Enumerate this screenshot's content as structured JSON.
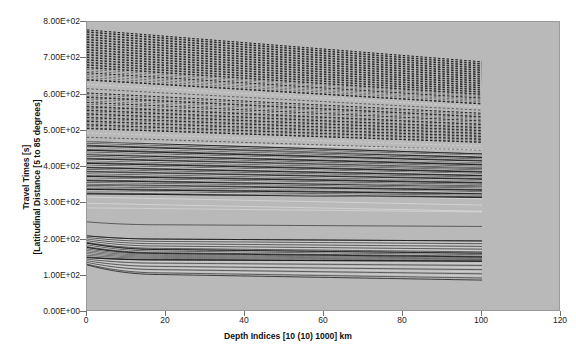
{
  "chart_data": {
    "type": "line",
    "title": "",
    "xlabel": "Depth Indices [10 (10) 1000] km",
    "ylabel_line1": "Travel Times [s]",
    "ylabel_line2": "[Latitudinal Distance [5 to 85 degrees]",
    "xlim": [
      0,
      120
    ],
    "ylim": [
      0,
      800
    ],
    "xticks": [
      0,
      20,
      40,
      60,
      80,
      100,
      120
    ],
    "xticklabels": [
      "0",
      "20",
      "40",
      "60",
      "80",
      "100",
      "120"
    ],
    "yticks": [
      0,
      100,
      200,
      300,
      400,
      500,
      600,
      700,
      800
    ],
    "yticklabels": [
      "0.00E+00",
      "1.00E+02",
      "2.00E+02",
      "3.00E+02",
      "4.00E+02",
      "5.00E+02",
      "6.00E+02",
      "7.00E+02",
      "8.00E+02"
    ],
    "grid": false,
    "legend": "none",
    "data_x_start": 0,
    "data_x_end": 100,
    "plot_bgcolor": "#b9b9b9",
    "line_color": "#151515",
    "series_note": "Dense family of seismic traveltime branches, one curve per latitudinal distance 5 to 85 degrees, plotted against depth index 10(10)1000 km.",
    "series": [
      {
        "name": "85 deg branch",
        "y_start": 778,
        "y_end": 690,
        "style": "dashed"
      },
      {
        "name": "83 deg branch",
        "y_start": 772,
        "y_end": 684,
        "style": "dashed"
      },
      {
        "name": "81 deg branch",
        "y_start": 765,
        "y_end": 678,
        "style": "dashed"
      },
      {
        "name": "79 deg branch",
        "y_start": 758,
        "y_end": 672,
        "style": "dashed"
      },
      {
        "name": "77 deg branch",
        "y_start": 751,
        "y_end": 666,
        "style": "dashed"
      },
      {
        "name": "75 deg branch",
        "y_start": 744,
        "y_end": 660,
        "style": "dashed"
      },
      {
        "name": "73 deg branch",
        "y_start": 737,
        "y_end": 654,
        "style": "dashed"
      },
      {
        "name": "71 deg branch",
        "y_start": 730,
        "y_end": 648,
        "style": "dashed"
      },
      {
        "name": "69 deg branch",
        "y_start": 723,
        "y_end": 642,
        "style": "dashed"
      },
      {
        "name": "67 deg branch",
        "y_start": 716,
        "y_end": 636,
        "style": "dashed"
      },
      {
        "name": "65 deg branch",
        "y_start": 709,
        "y_end": 630,
        "style": "dashed"
      },
      {
        "name": "63 deg branch",
        "y_start": 702,
        "y_end": 624,
        "style": "dashed"
      },
      {
        "name": "61 deg branch",
        "y_start": 695,
        "y_end": 618,
        "style": "dashed"
      },
      {
        "name": "59 deg branch",
        "y_start": 688,
        "y_end": 612,
        "style": "dashed"
      },
      {
        "name": "57 deg branch",
        "y_start": 681,
        "y_end": 606,
        "style": "dashed"
      },
      {
        "name": "55 deg branch",
        "y_start": 674,
        "y_end": 600,
        "style": "dashed"
      },
      {
        "name": "53 deg branch",
        "y_start": 660,
        "y_end": 590,
        "style": "dashed"
      },
      {
        "name": "51 deg branch",
        "y_start": 640,
        "y_end": 574,
        "style": "dashed"
      },
      {
        "name": "49 deg branch",
        "y_start": 604,
        "y_end": 548,
        "style": "dashed"
      },
      {
        "name": "47 deg branch",
        "y_start": 592,
        "y_end": 538,
        "style": "dashed"
      },
      {
        "name": "45 deg branch",
        "y_start": 578,
        "y_end": 527,
        "style": "dashed"
      },
      {
        "name": "43 deg branch",
        "y_start": 566,
        "y_end": 517,
        "style": "dashed"
      },
      {
        "name": "41 deg branch",
        "y_start": 556,
        "y_end": 508,
        "style": "dashed"
      },
      {
        "name": "39 deg branch",
        "y_start": 546,
        "y_end": 500,
        "style": "dashed"
      },
      {
        "name": "37 deg branch",
        "y_start": 536,
        "y_end": 492,
        "style": "dashed"
      },
      {
        "name": "35 deg branch",
        "y_start": 526,
        "y_end": 484,
        "style": "dashed"
      },
      {
        "name": "33 deg branch",
        "y_start": 516,
        "y_end": 476,
        "style": "dashed"
      },
      {
        "name": "31 deg branch",
        "y_start": 506,
        "y_end": 468,
        "style": "dashed"
      },
      {
        "name": "29 deg branch",
        "y_start": 470,
        "y_end": 436,
        "style": "solid"
      },
      {
        "name": "27 deg branch",
        "y_start": 458,
        "y_end": 426,
        "style": "solid"
      },
      {
        "name": "25 deg branch",
        "y_start": 446,
        "y_end": 416,
        "style": "solid"
      },
      {
        "name": "23 deg branch",
        "y_start": 434,
        "y_end": 406,
        "style": "solid"
      },
      {
        "name": "21 deg branch",
        "y_start": 422,
        "y_end": 396,
        "style": "solid"
      },
      {
        "name": "19 deg branch",
        "y_start": 410,
        "y_end": 386,
        "style": "solid"
      },
      {
        "name": "17 deg branch",
        "y_start": 398,
        "y_end": 376,
        "style": "solid"
      },
      {
        "name": "15 deg branch",
        "y_start": 386,
        "y_end": 366,
        "style": "solid"
      },
      {
        "name": "13 deg branch",
        "y_start": 374,
        "y_end": 356,
        "style": "solid"
      },
      {
        "name": "11 deg branch",
        "y_start": 362,
        "y_end": 346,
        "style": "solid"
      },
      {
        "name": "9 deg branch",
        "y_start": 350,
        "y_end": 336,
        "style": "solid"
      },
      {
        "name": "7 deg branch",
        "y_start": 338,
        "y_end": 326,
        "style": "solid"
      },
      {
        "name": "5 deg branch",
        "y_start": 326,
        "y_end": 316,
        "style": "solid"
      },
      {
        "name": "lower branch A",
        "y_start": 210,
        "y_end": 196,
        "style": "solid"
      },
      {
        "name": "lower branch B",
        "y_start": 190,
        "y_end": 162,
        "style": "solid"
      },
      {
        "name": "lower branch C",
        "y_start": 178,
        "y_end": 152,
        "style": "solid"
      },
      {
        "name": "lower branch D",
        "y_start": 150,
        "y_end": 140,
        "style": "solid"
      },
      {
        "name": "lowest branch",
        "y_start": 130,
        "y_end": 88,
        "style": "solid"
      }
    ]
  }
}
